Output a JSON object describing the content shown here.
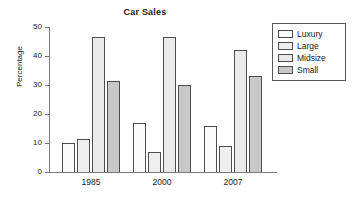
{
  "chart_data": {
    "type": "bar",
    "title": "Car Sales",
    "xlabel": "",
    "ylabel": "Percentage",
    "categories": [
      "1985",
      "2000",
      "2007"
    ],
    "series": [
      {
        "name": "Luxury",
        "values": [
          10,
          17,
          16
        ],
        "color": "#fbfbfb"
      },
      {
        "name": "Large",
        "values": [
          11.5,
          7,
          9
        ],
        "color": "#efefef"
      },
      {
        "name": "Midsize",
        "values": [
          46.5,
          46.5,
          42
        ],
        "color": "#eaeaea"
      },
      {
        "name": "Small",
        "values": [
          31.5,
          30,
          33
        ],
        "color": "#c8c8c8"
      }
    ],
    "ylim": [
      0,
      50
    ],
    "yticks": [
      0,
      10,
      20,
      30,
      40,
      50
    ],
    "ytick_labels": [
      "0",
      "10",
      "20",
      "30",
      "40",
      "50"
    ],
    "grid": false,
    "legend_position": "right-outside",
    "legend_entries": [
      "Luxury",
      "Large",
      "Midsize",
      "Small"
    ],
    "axis_color": "#7a7a7a",
    "bar_edge_color": "#4d4d4d",
    "background": "#ffffff"
  }
}
